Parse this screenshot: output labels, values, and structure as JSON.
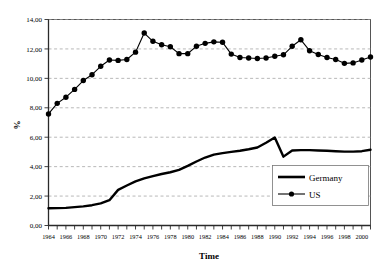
{
  "chart_data": {
    "type": "line",
    "title": "",
    "xlabel": "Time",
    "ylabel": "%",
    "xlim": [
      1964,
      2001
    ],
    "ylim": [
      0,
      14
    ],
    "ytick_labels": [
      "0,00",
      "2,00",
      "4,00",
      "6,00",
      "8,00",
      "10,00",
      "12,00",
      "14,00"
    ],
    "ytick_values": [
      0,
      2,
      4,
      6,
      8,
      10,
      12,
      14
    ],
    "grid": "horizontal-dashed",
    "legend_position": "lower-right-inside",
    "decimal_separator": "comma",
    "x": [
      1964,
      1965,
      1966,
      1967,
      1968,
      1969,
      1970,
      1971,
      1972,
      1973,
      1974,
      1975,
      1976,
      1977,
      1978,
      1979,
      1980,
      1981,
      1982,
      1983,
      1984,
      1985,
      1986,
      1987,
      1988,
      1989,
      1990,
      1991,
      1992,
      1993,
      1994,
      1995,
      1996,
      1997,
      1998,
      1999,
      2000,
      2001
    ],
    "xtick_labels": [
      "1964",
      "1966",
      "1968",
      "1970",
      "1972",
      "1974",
      "1976",
      "1978",
      "1980",
      "1982",
      "1984",
      "1986",
      "1988",
      "1990",
      "1992",
      "1994",
      "1996",
      "1998",
      "2000"
    ],
    "xtick_label_step": 2,
    "series": [
      {
        "name": "Germany",
        "style": "thick-line-no-marker",
        "color": "#000000",
        "values": [
          1.17,
          1.18,
          1.2,
          1.25,
          1.3,
          1.38,
          1.5,
          1.72,
          2.42,
          2.72,
          3.0,
          3.2,
          3.35,
          3.5,
          3.62,
          3.78,
          4.05,
          4.35,
          4.62,
          4.82,
          4.92,
          5.0,
          5.08,
          5.18,
          5.3,
          5.62,
          5.98,
          4.68,
          5.1,
          5.12,
          5.12,
          5.1,
          5.08,
          5.05,
          5.02,
          5.02,
          5.05,
          5.15
        ]
      },
      {
        "name": "US",
        "style": "line-with-round-marker",
        "color": "#000000",
        "values": [
          7.58,
          8.3,
          8.72,
          9.25,
          9.85,
          10.25,
          10.82,
          11.25,
          11.22,
          11.28,
          11.78,
          13.08,
          12.52,
          12.28,
          12.15,
          11.68,
          11.68,
          12.18,
          12.38,
          12.48,
          12.45,
          11.65,
          11.42,
          11.38,
          11.35,
          11.38,
          11.5,
          11.6,
          12.18,
          12.62,
          11.88,
          11.62,
          11.42,
          11.28,
          11.02,
          11.05,
          11.25,
          11.45
        ]
      }
    ]
  },
  "legend": {
    "items": [
      {
        "label": "Germany"
      },
      {
        "label": "US"
      }
    ]
  },
  "axes": {
    "x_title": "Time",
    "y_title": "%"
  }
}
